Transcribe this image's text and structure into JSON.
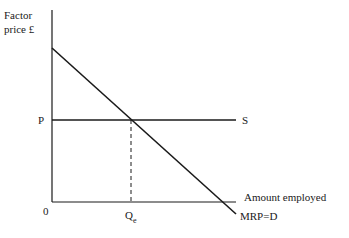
{
  "diagram": {
    "type": "factor-market-equilibrium",
    "y_axis_label_line1": "Factor",
    "y_axis_label_line2": "price £",
    "x_axis_label": "Amount employed",
    "origin_label": "0",
    "price_label": "P",
    "quantity_label_main": "Q",
    "quantity_label_sub": "e",
    "supply_label": "S",
    "demand_label": "MRP=D",
    "colors": {
      "line": "#1a1a1a",
      "background": "#ffffff"
    }
  }
}
